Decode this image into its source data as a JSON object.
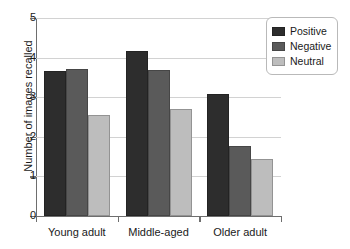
{
  "chart_data": {
    "type": "bar",
    "title": "",
    "subtitle": "",
    "xlabel": "",
    "ylabel": "Number of images recalled",
    "categories": [
      "Young adult",
      "Middle-aged",
      "Older adult"
    ],
    "series": [
      {
        "name": "Positive",
        "color": "#2d2d2d",
        "values": [
          3.67,
          4.17,
          3.08
        ]
      },
      {
        "name": "Negative",
        "color": "#5a5a5a",
        "values": [
          3.72,
          3.68,
          1.78
        ]
      },
      {
        "name": "Neutral",
        "color": "#bdbdbd",
        "values": [
          2.54,
          2.7,
          1.44
        ]
      }
    ],
    "ylim": [
      0,
      5
    ],
    "yticks": [
      0,
      1,
      2,
      3,
      4,
      5
    ],
    "ytick_labels": [
      "0",
      "1",
      "2",
      "3",
      "4",
      "5"
    ],
    "grid": true,
    "grid_axis": "y",
    "legend_position": "top-right",
    "legend_entries": [
      "Positive",
      "Negative",
      "Neutral"
    ]
  },
  "legend": {
    "items": [
      {
        "label": "Positive"
      },
      {
        "label": "Negative"
      },
      {
        "label": "Neutral"
      }
    ]
  },
  "axes": {
    "y_title": "Number of images recalled",
    "y_tick_0": "0",
    "y_tick_1": "1",
    "y_tick_2": "2",
    "y_tick_3": "3",
    "y_tick_4": "4",
    "y_tick_5": "5",
    "x_group_0": "Young adult",
    "x_group_1": "Middle-aged",
    "x_group_2": "Older adult"
  },
  "colors": {
    "positive": "#2d2d2d",
    "negative": "#5a5a5a",
    "neutral": "#bdbdbd",
    "axis": "#6e6e6e",
    "grid": "#d2d2d2"
  }
}
